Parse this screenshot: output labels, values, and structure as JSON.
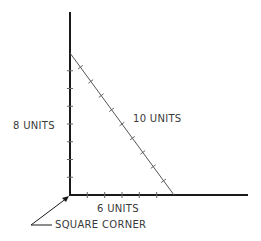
{
  "diagram": {
    "labels": {
      "vertical_side": "8 UNITS",
      "hypotenuse": "10 UNITS",
      "horizontal_side": "6 UNITS",
      "corner_callout": "SQUARE CORNER"
    },
    "sides": {
      "vertical_units": 8,
      "horizontal_units": 6,
      "hypotenuse_units": 10
    },
    "colors": {
      "axis": "#1a1a1a",
      "hypotenuse": "#555555",
      "text": "#3a3a3a",
      "background": "#ffffff"
    }
  }
}
